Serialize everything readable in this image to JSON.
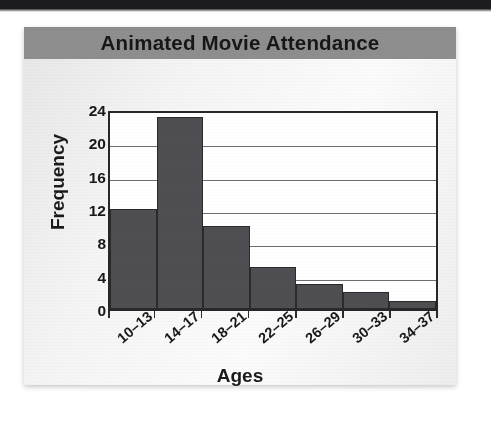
{
  "page": {
    "background_color": "#ffffff",
    "top_band_color": "#1c1c1e"
  },
  "card": {
    "background_color": "#f1f1f1",
    "banner_color": "#8e8e8e"
  },
  "chart_data": {
    "type": "bar",
    "title": "Animated Movie Attendance",
    "xlabel": "Ages",
    "ylabel": "Frequency",
    "categories": [
      "10–13",
      "14–17",
      "18–21",
      "22–25",
      "26–29",
      "30–33",
      "34–37"
    ],
    "values": [
      12,
      23,
      10,
      5,
      3,
      2,
      1
    ],
    "ylim": [
      0,
      24
    ],
    "yticks": [
      0,
      4,
      8,
      12,
      16,
      20,
      24
    ],
    "grid": true,
    "grid_axis": "y",
    "legend": false,
    "bar_fill_color": "#4f4f53",
    "bar_border_color": "#2a2a2d",
    "gridline_color": "#6e6e72",
    "axis_color": "#27272a",
    "plot_background": "#ffffff"
  }
}
